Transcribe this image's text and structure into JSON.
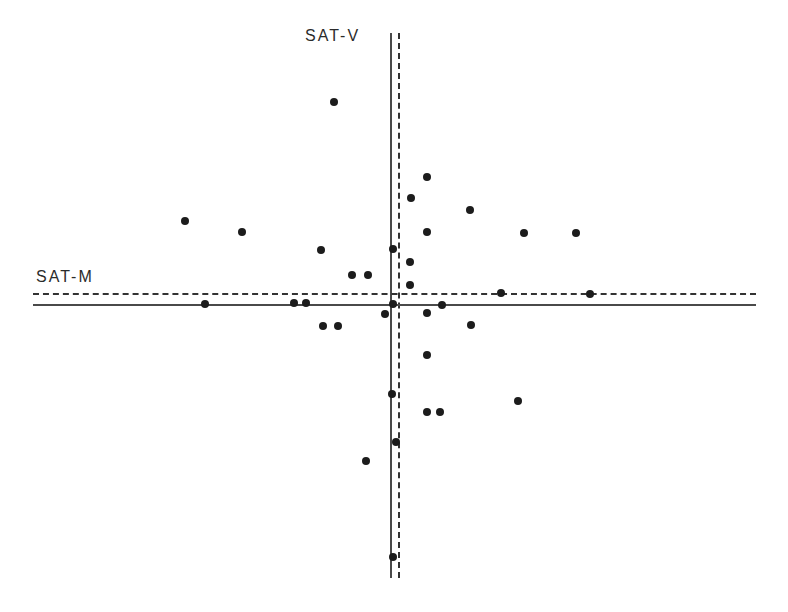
{
  "figure": {
    "width": 788,
    "height": 612,
    "background": "#ffffff",
    "point_color": "#1c1c1c",
    "solid_line_color": "#4a4a4a",
    "dashed_line_color": "#333333"
  },
  "labels": {
    "vertical_axis": "SAT-V",
    "horizontal_axis": "SAT-M"
  },
  "chart_data": {
    "type": "scatter",
    "title": "",
    "subtitle": "",
    "xlabel": "SAT-M",
    "ylabel": "SAT-V",
    "grid": false,
    "legend": null,
    "axis_style": {
      "note": "Two crossed reference axes: a solid pair and a dashed pair offset slightly from each other",
      "vertical_solid_x": 390,
      "vertical_dashed_x": 398,
      "vertical_extent_y": [
        33,
        578
      ],
      "horizontal_solid_y": 304,
      "horizontal_dashed_y": 293,
      "horizontal_extent_x": [
        33,
        756
      ]
    },
    "points": [
      {
        "x": 334,
        "y": 102
      },
      {
        "x": 427,
        "y": 177
      },
      {
        "x": 411,
        "y": 198
      },
      {
        "x": 185,
        "y": 221
      },
      {
        "x": 470,
        "y": 210
      },
      {
        "x": 242,
        "y": 232
      },
      {
        "x": 427,
        "y": 232
      },
      {
        "x": 524,
        "y": 233
      },
      {
        "x": 576,
        "y": 233
      },
      {
        "x": 321,
        "y": 250
      },
      {
        "x": 393,
        "y": 249
      },
      {
        "x": 410,
        "y": 262
      },
      {
        "x": 352,
        "y": 275
      },
      {
        "x": 368,
        "y": 275
      },
      {
        "x": 410,
        "y": 285
      },
      {
        "x": 501,
        "y": 293
      },
      {
        "x": 590,
        "y": 294
      },
      {
        "x": 205,
        "y": 304
      },
      {
        "x": 294,
        "y": 303
      },
      {
        "x": 306,
        "y": 303
      },
      {
        "x": 385,
        "y": 314
      },
      {
        "x": 393,
        "y": 304
      },
      {
        "x": 442,
        "y": 305
      },
      {
        "x": 427,
        "y": 313
      },
      {
        "x": 323,
        "y": 326
      },
      {
        "x": 338,
        "y": 326
      },
      {
        "x": 471,
        "y": 325
      },
      {
        "x": 427,
        "y": 355
      },
      {
        "x": 392,
        "y": 394
      },
      {
        "x": 518,
        "y": 401
      },
      {
        "x": 427,
        "y": 412
      },
      {
        "x": 440,
        "y": 412
      },
      {
        "x": 396,
        "y": 442
      },
      {
        "x": 366,
        "y": 461
      },
      {
        "x": 393,
        "y": 557
      }
    ]
  }
}
